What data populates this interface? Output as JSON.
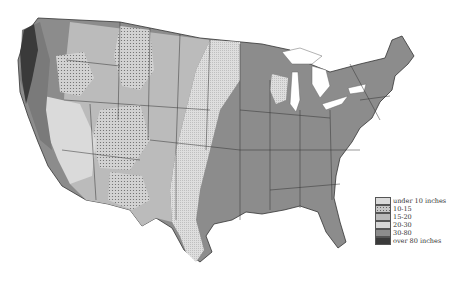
{
  "map": {
    "subject": "Average annual precipitation, contiguous United States",
    "style": "grayscale"
  },
  "legend": {
    "items": [
      {
        "label": "under 10 inches",
        "color": "#d9d9d9",
        "pattern": "light-fine"
      },
      {
        "label": "10-15",
        "color": "#c4c4c4",
        "pattern": "dotted"
      },
      {
        "label": "15-20",
        "color": "#b8b8b8",
        "pattern": "solid"
      },
      {
        "label": "20-30",
        "color": "#cfcfcf",
        "pattern": "stippled"
      },
      {
        "label": "30-80",
        "color": "#8a8a8a",
        "pattern": "solid"
      },
      {
        "label": "over 80 inches",
        "color": "#3c3c3c",
        "pattern": "solid"
      }
    ]
  },
  "colors": {
    "background": "#ffffff",
    "border": "#333333",
    "water": "#ffffff",
    "east_30_80": "#8c8c8c",
    "plains_20_30": "#d6d6d6",
    "mid_15_20": "#b9b9b9",
    "dry_under_10": "#dadada",
    "dotted_10_15": "#c6c6c6",
    "wet_over_80": "#3a3a3a"
  }
}
